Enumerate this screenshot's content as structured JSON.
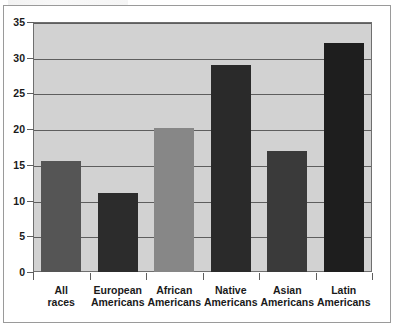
{
  "chart_data": {
    "type": "bar",
    "title": "",
    "subtitle": "",
    "xlabel": "",
    "ylabel": "",
    "categories": [
      "All races",
      "European Americans",
      "African Americans",
      "Native Americans",
      "Asian Americans",
      "Latin Americans"
    ],
    "category_lines": [
      [
        "All",
        "races"
      ],
      [
        "European",
        "Americans"
      ],
      [
        "African",
        "Americans"
      ],
      [
        "Native",
        "Americans"
      ],
      [
        "Asian",
        "Americans"
      ],
      [
        "Latin",
        "Americans"
      ]
    ],
    "values": [
      15.5,
      11.0,
      20.2,
      29.0,
      17.0,
      32.0
    ],
    "ylim": [
      0,
      35
    ],
    "yticks": [
      0,
      5,
      10,
      15,
      20,
      25,
      30,
      35
    ],
    "ytick_labels": [
      "0",
      "5",
      "10",
      "15",
      "20",
      "25",
      "30",
      "35"
    ],
    "grid": true,
    "legend": "none",
    "bar_colors": [
      "#555555",
      "#2c2c2c",
      "#878787",
      "#2a2a2a",
      "#3a3a3a",
      "#1e1e1e"
    ],
    "plot_background": "#d2d2d2",
    "gridline_color": "#5e5e5e",
    "axis_color": "#6f6f6f"
  }
}
